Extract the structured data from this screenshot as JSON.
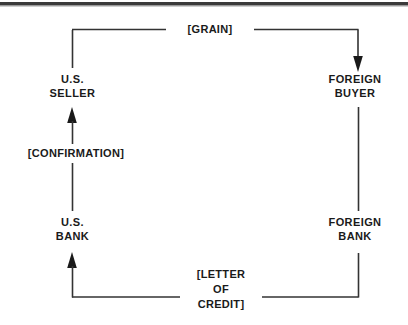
{
  "diagram": {
    "type": "trade-finance-flow",
    "title": "",
    "colors": {
      "line": "#333333",
      "text": "#1a1a1a",
      "background": "#ffffff",
      "top_rule": "#3a3a3a"
    },
    "nodes": [
      {
        "id": "us-seller",
        "lines": [
          "U.S.",
          "SELLER"
        ],
        "label": "U.S.\nSELLER",
        "position": "top-left"
      },
      {
        "id": "foreign-buyer",
        "lines": [
          "FOREIGN",
          "BUYER"
        ],
        "label": "FOREIGN\nBUYER",
        "position": "top-right"
      },
      {
        "id": "us-bank",
        "lines": [
          "U.S.",
          "BANK"
        ],
        "label": "U.S.\nBANK",
        "position": "bottom-left"
      },
      {
        "id": "foreign-bank",
        "lines": [
          "FOREIGN",
          "BANK"
        ],
        "label": "FOREIGN\nBANK",
        "position": "bottom-right"
      }
    ],
    "flows": [
      {
        "id": "grain",
        "label": "[GRAIN]",
        "from": "us-seller",
        "to": "foreign-buyer",
        "direction": "left-to-right",
        "arrow_at": "foreign-buyer"
      },
      {
        "id": "confirmation",
        "label": "[CONFIRMATION]",
        "from": "us-bank",
        "to": "us-seller",
        "direction": "bottom-to-top",
        "arrow_at": "us-seller"
      },
      {
        "id": "letter-of-credit",
        "label": "[LETTER OF CREDIT]",
        "label_lines": [
          "[LETTER",
          "OF",
          "CREDIT]"
        ],
        "from": "foreign-bank",
        "to": "us-bank",
        "direction": "right-to-left",
        "arrow_at": "us-bank"
      }
    ],
    "node_text": {
      "us_seller_line1": "U.S.",
      "us_seller_line2": "SELLER",
      "foreign_buyer_line1": "FOREIGN",
      "foreign_buyer_line2": "BUYER",
      "us_bank_line1": "U.S.",
      "us_bank_line2": "BANK",
      "foreign_bank_line1": "FOREIGN",
      "foreign_bank_line2": "BANK"
    },
    "flow_text": {
      "grain": "[GRAIN]",
      "confirmation": "[CONFIRMATION]",
      "loc_line1": "[LETTER",
      "loc_line2": "OF",
      "loc_line3": "CREDIT]"
    }
  }
}
